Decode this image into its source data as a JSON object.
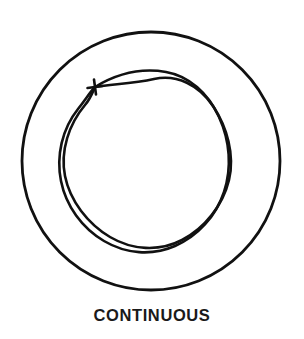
{
  "figure": {
    "caption": "CONTINUOUS",
    "background_color": "#ffffff",
    "ink_color": "#111111",
    "canvas": {
      "width": 304,
      "height": 339
    },
    "outer_circle": {
      "name": "boundary-circle",
      "center_x": 151,
      "center_y": 161,
      "radius": 129,
      "stroke_width": 2.8,
      "stroke_color": "#111111",
      "fill": "none"
    },
    "start_marker": {
      "name": "start-cross-marker",
      "glyph": "plus-cross",
      "center_x": 95,
      "center_y": 87,
      "size": 15,
      "stroke_width": 2.6,
      "stroke_color": "#111111"
    },
    "scribble": {
      "name": "continuous-loop-scribble",
      "description": "Two out-of-phase closed wavy loops crossing repeatedly to form lens shapes around the ring",
      "center_x": 146,
      "center_y": 161,
      "mean_radius": 86,
      "lobes": 8,
      "stroke_width": 2.6,
      "stroke_color": "#111111",
      "bounds": {
        "left": 60,
        "top": 72,
        "right": 232,
        "bottom": 250
      },
      "path_a": "M 95,87 C 118,73 143,68 166,72 C 189,76 208,93 219,117 C 230,141 232,168 224,192 C 216,216 198,236 175,246 C 152,256 126,254 104,241 C 82,228 66,206 61,181 C 56,156 62,129 78,109 C 86,99 90,92 95,87 Z",
      "path_b": "M 95,87 C 112,84 132,84 154,79 C 177,74 199,85 213,106 C 227,127 235,155 229,180 C 223,205 205,228 182,240 C 159,252 132,250 110,237 C 88,224 70,201 65,176 C 60,151 69,124 85,105 C 91,98 93,91 95,87 Z"
    }
  }
}
